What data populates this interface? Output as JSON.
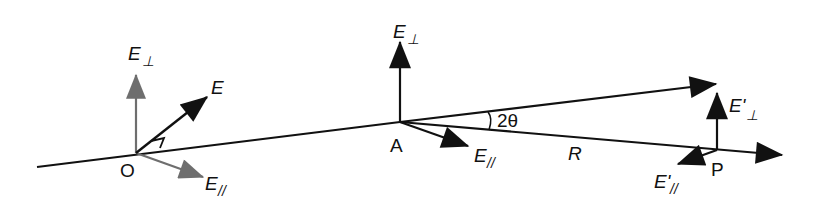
{
  "figure": {
    "points": {
      "origin": "O",
      "scatter": "A",
      "observer": "P"
    },
    "labels": {
      "E_perp_O": {
        "main": "E",
        "sub": "⊥"
      },
      "E_O": {
        "main": "E"
      },
      "E_par_O": {
        "main": "E",
        "sub": "//"
      },
      "E_perp_A": {
        "main": "E",
        "sub": "⊥"
      },
      "E_par_A": {
        "main": "E",
        "sub": "//"
      },
      "angle": "2θ",
      "distance": "R",
      "E_perp_P": {
        "main": "E'",
        "sub": "⊥"
      },
      "E_par_P": {
        "main": "E'",
        "sub": "//"
      }
    },
    "colors": {
      "line": "#111111",
      "incident_components": "#6e6e6e"
    }
  }
}
